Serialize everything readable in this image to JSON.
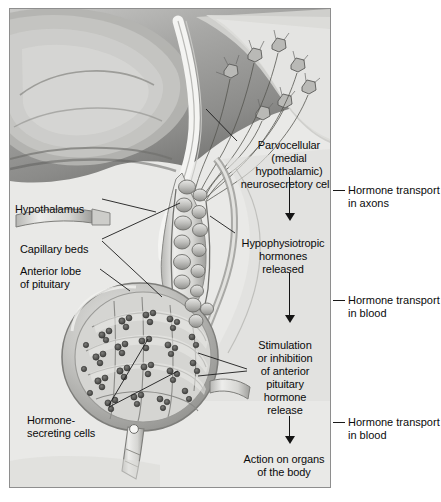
{
  "figure": {
    "panel_background": "#e9e9e7",
    "ink": "#0b0b0b"
  },
  "inside_labels": [
    {
      "id": "parvocellular",
      "name": "parvocellular-cells-label",
      "text": "Parvocellular\n(medial hypothalamic)\nneurosecretory cells",
      "x": 236,
      "y": 130,
      "w": 104,
      "align": "center"
    },
    {
      "id": "hypophysiotropic",
      "name": "hypophysiotropic-hormones-label",
      "text": "Hypophysiotropic\nhormones\nreleased",
      "x": 234,
      "y": 228,
      "w": 92,
      "align": "center"
    },
    {
      "id": "stimulation",
      "name": "stimulation-inhibition-label",
      "text": "Stimulation\nor inhibition\nof anterior\npituitary\nhormone\nrelease",
      "x": 246,
      "y": 330,
      "w": 74,
      "align": "center"
    },
    {
      "id": "action",
      "name": "action-on-organs-label",
      "text": "Action on organs\nof the body",
      "x": 234,
      "y": 444,
      "w": 96,
      "align": "center"
    },
    {
      "id": "hypothalamus",
      "name": "hypothalamus-label",
      "text": "Hypothalamus",
      "x": 14,
      "y": 194,
      "w": 86,
      "align": "left"
    },
    {
      "id": "capillary",
      "name": "capillary-beds-label",
      "text": "Capillary beds",
      "x": 19,
      "y": 234,
      "w": 82,
      "align": "left"
    },
    {
      "id": "anterior-lobe",
      "name": "anterior-lobe-label",
      "text": "Anterior lobe\nof pituitary",
      "x": 19,
      "y": 256,
      "w": 78,
      "align": "left"
    },
    {
      "id": "hormone-secreting",
      "name": "hormone-secreting-cells-label",
      "text": "Hormone-\nsecreting cells",
      "x": 26,
      "y": 405,
      "w": 82,
      "align": "left"
    }
  ],
  "right_captions": [
    {
      "id": "axons",
      "name": "hormone-transport-axons-caption",
      "text": "Hormone transport\nin axons",
      "x": 348,
      "y": 185,
      "tick_x": 334,
      "tick_y": 191,
      "tick_w": 11
    },
    {
      "id": "blood1",
      "name": "hormone-transport-blood-caption-1",
      "text": "Hormone transport\nin blood",
      "x": 348,
      "y": 295,
      "tick_x": 334,
      "tick_y": 301,
      "tick_w": 11
    },
    {
      "id": "blood2",
      "name": "hormone-transport-blood-caption-2",
      "text": "Hormone transport\nin blood",
      "x": 348,
      "y": 417,
      "tick_x": 334,
      "tick_y": 423,
      "tick_w": 11
    }
  ],
  "flow_arrows": [
    {
      "id": "arrow-1",
      "name": "flow-arrow-axon-transport",
      "x": 283,
      "y": 176,
      "length": 44
    },
    {
      "id": "arrow-2",
      "name": "flow-arrow-blood-transport-1",
      "x": 283,
      "y": 272,
      "length": 50
    },
    {
      "id": "arrow-3",
      "name": "flow-arrow-blood-transport-2",
      "x": 283,
      "y": 415,
      "length": 24
    }
  ],
  "anatomy_parts": [
    {
      "name": "brain-tissue-region",
      "description": "cerebrum / third ventricle wall, grayscale shaded"
    },
    {
      "name": "neurosecretory-cell-bodies",
      "description": "star-shaped parvocellular neuron somata"
    },
    {
      "name": "axon-bundle",
      "description": "axons descending into median eminence"
    },
    {
      "name": "primary-capillary-plexus",
      "description": "capillary bed in median eminence / stalk"
    },
    {
      "name": "hypophyseal-portal-vessels",
      "description": "portal veins in infundibular stalk"
    },
    {
      "name": "anterior-pituitary-lobe",
      "description": "pars distalis with secretory cell cords"
    },
    {
      "name": "secondary-capillary-plexus",
      "description": "sinusoids among hormone-secreting cells"
    },
    {
      "name": "hormone-secreting-cell-clusters",
      "description": "dark granular endocrine cell clusters"
    },
    {
      "name": "efferent-vein",
      "description": "vein leaving pituitary to systemic circulation"
    }
  ],
  "leader_lines": [
    {
      "name": "leader-hypothalamus",
      "from": [
        101,
        199
      ],
      "to": [
        155,
        207
      ]
    },
    {
      "name": "leader-capillary-beds-upper",
      "from": [
        101,
        238
      ],
      "to": [
        178,
        198
      ]
    },
    {
      "name": "leader-capillary-beds-lower",
      "from": [
        101,
        240
      ],
      "to": [
        160,
        292
      ]
    },
    {
      "name": "leader-anterior-lobe",
      "from": [
        99,
        268
      ],
      "to": [
        128,
        288
      ]
    },
    {
      "name": "leader-hormone-cells-a",
      "from": [
        108,
        404
      ],
      "to": [
        146,
        338
      ]
    },
    {
      "name": "leader-hormone-cells-b",
      "from": [
        108,
        406
      ],
      "to": [
        176,
        370
      ]
    },
    {
      "name": "leader-parvocellular",
      "from": [
        236,
        140
      ],
      "to": [
        205,
        108
      ]
    },
    {
      "name": "leader-hypophysiotropic",
      "from": [
        236,
        232
      ],
      "to": [
        209,
        215
      ]
    },
    {
      "name": "leader-stimulation-a",
      "from": [
        246,
        368
      ],
      "to": [
        196,
        352
      ]
    },
    {
      "name": "leader-stimulation-b",
      "from": [
        246,
        370
      ],
      "to": [
        196,
        375
      ]
    }
  ]
}
